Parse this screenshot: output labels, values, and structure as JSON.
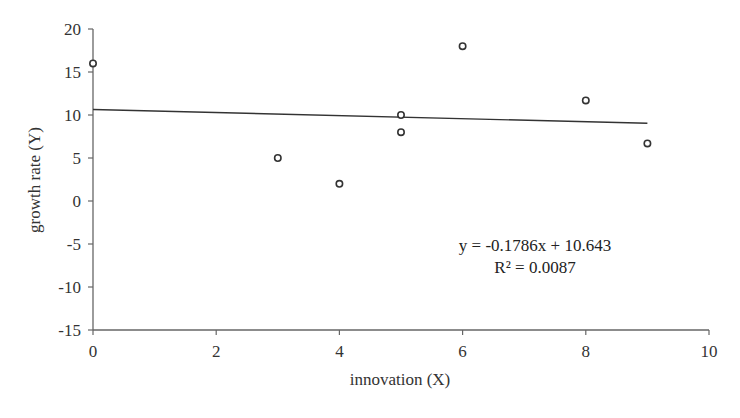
{
  "chart_data": {
    "type": "scatter",
    "title": "",
    "xlabel": "innovation (X)",
    "ylabel": "growth rate (Y)",
    "xlim": [
      0,
      10
    ],
    "ylim": [
      -15,
      20
    ],
    "xticks": [
      0,
      2,
      4,
      6,
      8,
      10
    ],
    "yticks": [
      20,
      15,
      10,
      5,
      0,
      -5,
      -10,
      -15
    ],
    "grid": false,
    "legend": null,
    "series": [
      {
        "name": "observations",
        "marker": "open-circle",
        "points": [
          {
            "x": 0,
            "y": 16
          },
          {
            "x": 3,
            "y": 5
          },
          {
            "x": 4,
            "y": 2
          },
          {
            "x": 5,
            "y": 10
          },
          {
            "x": 5,
            "y": 8
          },
          {
            "x": 6,
            "y": 18
          },
          {
            "x": 8,
            "y": 11.7
          },
          {
            "x": 9,
            "y": 6.7
          }
        ]
      }
    ],
    "trendline": {
      "type": "linear",
      "slope": -0.1786,
      "intercept": 10.643,
      "x_range": [
        0,
        9
      ]
    },
    "annotations": [
      {
        "text": "y = -0.1786x + 10.643"
      },
      {
        "text": "R² = 0.0087"
      }
    ]
  },
  "labels": {
    "xlabel": "innovation (X)",
    "ylabel": "growth rate (Y)",
    "equation": "y = -0.1786x + 10.643",
    "r_squared": "R² = 0.0087"
  },
  "colors": {
    "axis": "#666666",
    "marker": "#333333",
    "trendline": "#333333",
    "text": "#333333"
  }
}
